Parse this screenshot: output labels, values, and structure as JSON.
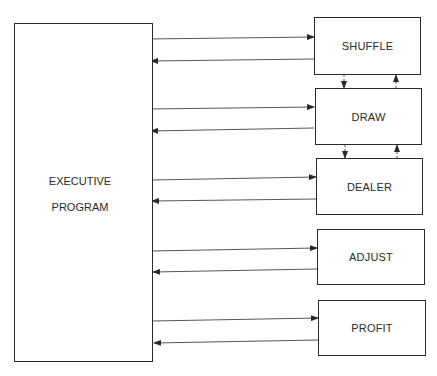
{
  "diagram": {
    "executive": {
      "line1": "EXECUTIVE",
      "line2": "PROGRAM"
    },
    "modules": [
      {
        "label": "SHUFFLE"
      },
      {
        "label": "DRAW"
      },
      {
        "label": "DEALER"
      },
      {
        "label": "ADJUST"
      },
      {
        "label": "PROFIT"
      }
    ],
    "connections": [
      "EXECUTIVE PROGRAM -> SHUFFLE",
      "SHUFFLE -> EXECUTIVE PROGRAM",
      "EXECUTIVE PROGRAM -> DRAW",
      "DRAW -> EXECUTIVE PROGRAM",
      "EXECUTIVE PROGRAM -> DEALER",
      "DEALER -> EXECUTIVE PROGRAM",
      "EXECUTIVE PROGRAM -> ADJUST",
      "ADJUST -> EXECUTIVE PROGRAM",
      "EXECUTIVE PROGRAM -> PROFIT",
      "PROFIT -> EXECUTIVE PROGRAM",
      "SHUFFLE <-> DRAW",
      "DRAW <-> DEALER"
    ]
  }
}
